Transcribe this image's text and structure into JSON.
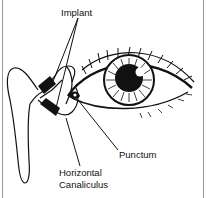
{
  "figure": {
    "labels": {
      "implant": "Implant",
      "punctum": "Punctum",
      "canaliculus_line1": "Horizontal",
      "canaliculus_line2": "Canaliculus"
    },
    "colors": {
      "ink": "#111111",
      "background": "#ffffff",
      "frame": "#9a9a9a"
    }
  }
}
